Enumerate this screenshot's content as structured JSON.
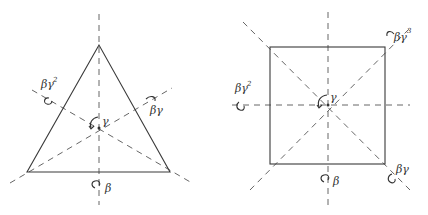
{
  "diagrams": [
    {
      "name": "triangle-symmetries",
      "shape": "equilateral triangle",
      "labels": {
        "rotation_center": "γ",
        "bottom_axis": "β",
        "left_axis": "βγ",
        "left_axis_exp": "2",
        "right_axis": "βγ"
      }
    },
    {
      "name": "square-symmetries",
      "shape": "square",
      "labels": {
        "rotation_center": "γ",
        "bottom_axis": "β",
        "left_axis": "βγ",
        "left_axis_exp": "2",
        "top_right_axis": "βγ",
        "top_right_axis_exp": "3",
        "bottom_right_axis": "βγ"
      }
    }
  ]
}
